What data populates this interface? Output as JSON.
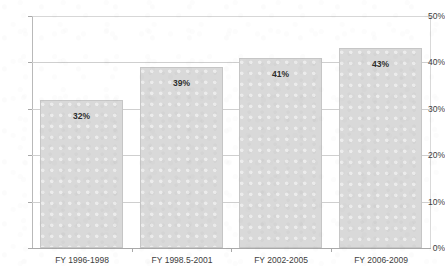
{
  "chart_data": {
    "type": "bar",
    "title": "",
    "title_note": "title row is cropped off the top edge of the screenshot; only descender fragments are visible",
    "categories": [
      "FY 1996-1998",
      "FY 1998.5-2001",
      "FY 2002-2005",
      "FY 2006-2009"
    ],
    "values": [
      32,
      39,
      41,
      43
    ],
    "value_labels": [
      "32%",
      "39%",
      "41%",
      "43%"
    ],
    "xlabel": "",
    "ylabel": "",
    "ylim": [
      0,
      50
    ],
    "ytick_labels": [
      "0%",
      "10%",
      "20%",
      "30%",
      "40%",
      "50%"
    ],
    "ytick_values": [
      0,
      10,
      20,
      30,
      40,
      50
    ],
    "grid": true,
    "legend": false,
    "bar_color": "#d9d9d9",
    "bar_border_color": "#c6c6c6",
    "gridline_color": "#cfcfcf",
    "axis_color": "#a9a9a9",
    "text_color": "#3d3d3d"
  }
}
